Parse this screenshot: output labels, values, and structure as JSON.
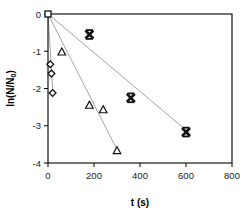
{
  "chart_data": {
    "type": "scatter",
    "title": "",
    "xlabel": "t (s)",
    "ylabel": "ln(N/N0)",
    "ylabel_main": "ln(N/N",
    "ylabel_sub": "0",
    "ylabel_tail": ")",
    "xlim": [
      0,
      800
    ],
    "ylim": [
      -4,
      0
    ],
    "xticks": [
      0,
      200,
      400,
      600,
      800
    ],
    "xtick_labels": [
      "0",
      "200",
      "400",
      "600",
      "800"
    ],
    "yticks": [
      0,
      -1,
      -2,
      -3,
      -4
    ],
    "ytick_labels": [
      "0",
      "-1",
      "-2",
      "-3",
      "-4"
    ],
    "grid": false,
    "legend": "none",
    "frame": true,
    "series": [
      {
        "name": "origin",
        "marker": "square-open",
        "points": [
          [
            0,
            0
          ]
        ]
      },
      {
        "name": "diamond-series",
        "marker": "diamond-open",
        "points": [
          [
            10,
            -1.35
          ],
          [
            15,
            -1.6
          ],
          [
            20,
            -2.12
          ]
        ]
      },
      {
        "name": "triangle-series",
        "marker": "triangle-open",
        "points": [
          [
            60,
            -1.02
          ],
          [
            180,
            -2.45
          ],
          [
            240,
            -2.57
          ],
          [
            300,
            -3.67
          ]
        ]
      },
      {
        "name": "cross-series",
        "marker": "heavy-x",
        "points": [
          [
            180,
            -0.55
          ],
          [
            360,
            -2.25
          ],
          [
            600,
            -3.17
          ]
        ]
      }
    ],
    "trend_lines": [
      {
        "name": "trend-shallow",
        "from": [
          0,
          0
        ],
        "to": [
          620,
          -3.22
        ]
      },
      {
        "name": "trend-steep",
        "from": [
          0,
          0
        ],
        "to": [
          305,
          -3.7
        ]
      },
      {
        "name": "trend-diamond",
        "from": [
          0,
          0
        ],
        "to": [
          22,
          -2.2
        ]
      }
    ],
    "colors": {
      "axis": "#000000",
      "marker": "#111111",
      "trend_line": "#9a9a9a"
    }
  }
}
